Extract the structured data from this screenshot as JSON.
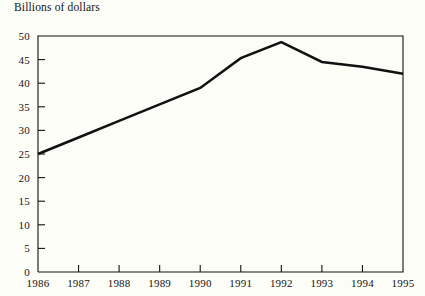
{
  "chart_data": {
    "type": "line",
    "title": "Billions of dollars",
    "xlabel": "",
    "ylabel": "",
    "categories": [
      "1986",
      "1987",
      "1988",
      "1989",
      "1990",
      "1991",
      "1992",
      "1993",
      "1994",
      "1995"
    ],
    "values": [
      25.0,
      28.5,
      32.0,
      35.5,
      39.0,
      45.3,
      48.7,
      44.5,
      43.5,
      42.0
    ],
    "series": [
      {
        "name": "Billions of dollars",
        "values": [
          25.0,
          28.5,
          32.0,
          35.5,
          39.0,
          45.3,
          48.7,
          44.5,
          43.5,
          42.0
        ]
      }
    ],
    "xlim": [
      "1986",
      "1995"
    ],
    "ylim": [
      0,
      50
    ],
    "ytick_values": [
      0,
      5,
      10,
      15,
      20,
      25,
      30,
      35,
      40,
      45,
      50
    ],
    "ytick_labels": [
      "0",
      "5",
      "10",
      "15",
      "20",
      "25",
      "30",
      "35",
      "40",
      "45",
      "50"
    ],
    "xtick_labels": [
      "1986",
      "1987",
      "1988",
      "1989",
      "1990",
      "1991",
      "1992",
      "1993",
      "1994",
      "1995"
    ],
    "grid": false,
    "legend": false,
    "legend_position": "none",
    "line_color": "#111111",
    "background_color": "#fdfdf8",
    "axis_color": "#111111",
    "annotations": []
  }
}
